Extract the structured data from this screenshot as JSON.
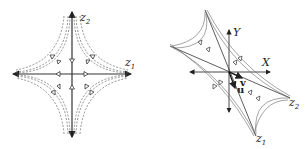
{
  "left_diagram": {
    "axis_x_label": "z",
    "axis_x_sub": "1",
    "axis_y_label": "z",
    "axis_y_sub": "2"
  },
  "right_diagram": {
    "axis_x_label": "X",
    "axis_y_label": "Y",
    "vector_u_label": "u",
    "vector_v_label": "v",
    "z1_label": "z",
    "z1_sub": "1",
    "z2_label": "z",
    "z2_sub": "2"
  },
  "colors": {
    "stroke": "#333333",
    "trajectory": "#666666"
  }
}
